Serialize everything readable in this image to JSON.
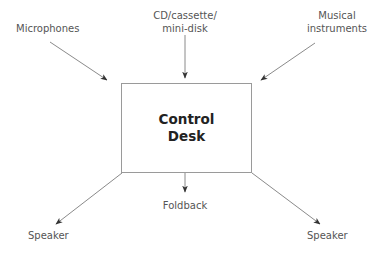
{
  "diagram": {
    "center": {
      "line1": "Control",
      "line2": "Desk"
    },
    "inputs": [
      {
        "id": "microphones",
        "lines": [
          "Microphones"
        ]
      },
      {
        "id": "cd",
        "lines": [
          "CD/cassette/",
          "mini-disk"
        ]
      },
      {
        "id": "instruments",
        "lines": [
          "Musical",
          "instruments"
        ]
      }
    ],
    "outputs": [
      {
        "id": "speaker-left",
        "lines": [
          "Speaker"
        ]
      },
      {
        "id": "foldback",
        "lines": [
          "Foldback"
        ]
      },
      {
        "id": "speaker-right",
        "lines": [
          "Speaker"
        ]
      }
    ],
    "colors": {
      "line": "#8a8a8a",
      "arrowhead": "#333333",
      "label": "#555555",
      "title": "#222222"
    }
  }
}
